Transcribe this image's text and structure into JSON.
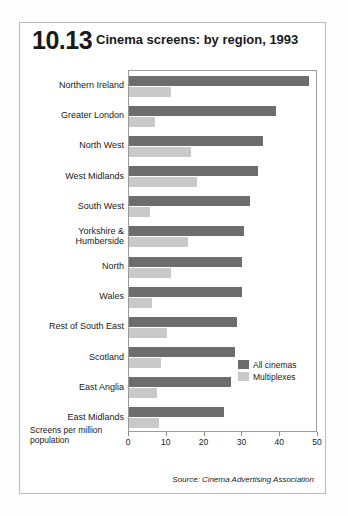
{
  "header": {
    "figure_number": "10.13",
    "title": "Cinema screens: by region, 1993"
  },
  "axis_caption": "Screens per million population",
  "source": "Source: Cinema Advertising Association",
  "legend": {
    "items": [
      {
        "label": "All cinemas",
        "color": "#6d6d6d"
      },
      {
        "label": "Multiplexes",
        "color": "#c9c9c9"
      }
    ]
  },
  "colors": {
    "all_cinemas": "#6d6d6d",
    "multiplexes": "#c9c9c9",
    "frame": "#b9b9b9",
    "plot_border": "#9a9a9a",
    "text": "#1a1a1a"
  },
  "chart_data": {
    "type": "bar",
    "orientation": "horizontal",
    "title": "Cinema screens: by region, 1993",
    "subtitle": "",
    "xlabel": "Screens per million population",
    "ylabel": "",
    "xlim": [
      0,
      50
    ],
    "xticks": [
      0,
      10,
      20,
      30,
      40,
      50
    ],
    "xtick_labels": [
      "0",
      "10",
      "20",
      "30",
      "40",
      "50"
    ],
    "grid": false,
    "legend_position": "inside-bottom-right",
    "categories": [
      "Northern Ireland",
      "Greater London",
      "North West",
      "West Midlands",
      "South West",
      "Yorkshire &\nHumberside",
      "North",
      "Wales",
      "Rest of South East",
      "Scotland",
      "East Anglia",
      "East Midlands"
    ],
    "series": [
      {
        "name": "All cinemas",
        "color": "#6d6d6d",
        "values": [
          47.5,
          39,
          35.5,
          34,
          32,
          30.5,
          30,
          30,
          28.5,
          28,
          27,
          25
        ]
      },
      {
        "name": "Multiplexes",
        "color": "#c9c9c9",
        "values": [
          11,
          7,
          16.5,
          18,
          5.5,
          15.5,
          11,
          6,
          10,
          8.5,
          7.5,
          8
        ]
      }
    ]
  }
}
